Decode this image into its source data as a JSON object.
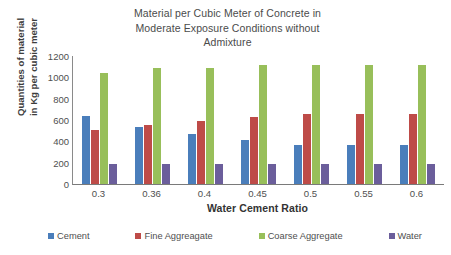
{
  "chart_data": {
    "type": "bar",
    "title": "Material per Cubic Meter of Concrete in Moderate Exposure Conditions without Admixture",
    "title_lines": [
      "Material per Cubic Meter of Concrete in",
      "Moderate Exposure Conditions without",
      "Admixture"
    ],
    "xlabel": "Water Cement Ratio",
    "ylabel": "Quantities of material in Kg per cubic meter",
    "ylabel_lines": [
      "Quantities of material",
      "in Kg per cubic meter"
    ],
    "categories": [
      "0.3",
      "0.36",
      "0.4",
      "0.45",
      "0.5",
      "0.55",
      "0.6"
    ],
    "ylim": [
      0,
      1200
    ],
    "yticks": [
      0,
      200,
      400,
      600,
      800,
      1000,
      1200
    ],
    "grid": false,
    "legend_position": "bottom",
    "series": [
      {
        "name": "Cement",
        "color": "#4a7ebb",
        "values": [
          640,
          535,
          470,
          415,
          370,
          370,
          370
        ]
      },
      {
        "name": "Fine Aggreagate",
        "color": "#be4b48",
        "values": [
          510,
          555,
          590,
          625,
          655,
          655,
          655
        ]
      },
      {
        "name": "Coarse Aggregate",
        "color": "#98bf5a",
        "values": [
          1040,
          1090,
          1090,
          1120,
          1120,
          1120,
          1120
        ]
      },
      {
        "name": "Water",
        "color": "#6b5e9b",
        "values": [
          190,
          190,
          190,
          190,
          190,
          190,
          190
        ]
      }
    ]
  }
}
